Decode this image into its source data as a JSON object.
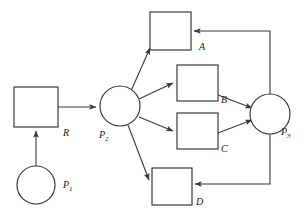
{
  "diagram": {
    "type": "directed-graph",
    "stroke_color": "#3a3a3a",
    "fill_color": "#ffffff",
    "background_color": "#ffffff",
    "places": [
      {
        "id": "P1",
        "label": "P",
        "sub": "1",
        "shape": "circle",
        "cx": 36,
        "cy": 185,
        "r": 19,
        "label_x": 63,
        "label_y": 188
      },
      {
        "id": "P2",
        "label": "P",
        "sub": "2",
        "shape": "circle",
        "cx": 120,
        "cy": 106,
        "r": 20,
        "label_x": 99,
        "label_y": 138
      },
      {
        "id": "P3",
        "label": "P",
        "sub": "3",
        "shape": "circle",
        "cx": 270,
        "cy": 114,
        "r": 20,
        "label_x": 281,
        "label_y": 135
      }
    ],
    "transitions": [
      {
        "id": "R",
        "label": "R",
        "shape": "rect",
        "x": 14,
        "y": 87,
        "w": 44,
        "h": 40,
        "label_x": 63,
        "label_y": 136
      },
      {
        "id": "A",
        "label": "A",
        "shape": "rect",
        "x": 150,
        "y": 12,
        "w": 41,
        "h": 38,
        "label_x": 199,
        "label_y": 50
      },
      {
        "id": "B",
        "label": "B",
        "shape": "rect",
        "x": 177,
        "y": 65,
        "w": 41,
        "h": 36,
        "label_x": 221,
        "label_y": 103
      },
      {
        "id": "C",
        "label": "C",
        "shape": "rect",
        "x": 177,
        "y": 113,
        "w": 41,
        "h": 36,
        "label_x": 221,
        "label_y": 152
      },
      {
        "id": "D",
        "label": "D",
        "shape": "rect",
        "x": 152,
        "y": 168,
        "w": 40,
        "h": 37,
        "label_x": 196,
        "label_y": 205
      }
    ],
    "edges": [
      {
        "id": "P1-R",
        "from": "P1",
        "to": "R",
        "points": "36,166 36,131",
        "arrow": true
      },
      {
        "id": "R-P2",
        "from": "R",
        "to": "P2",
        "points": "58,107 96,107",
        "arrow": true
      },
      {
        "id": "P2-A",
        "from": "P2",
        "to": "A",
        "points": "131,91 150,48",
        "arrow": true
      },
      {
        "id": "P2-B",
        "from": "P2",
        "to": "B",
        "points": "139,99 173,83",
        "arrow": true
      },
      {
        "id": "P2-C",
        "from": "P2",
        "to": "C",
        "points": "139,117 173,131",
        "arrow": true
      },
      {
        "id": "P2-D",
        "from": "P2",
        "to": "D",
        "points": "128,125 149,180",
        "arrow": true
      },
      {
        "id": "B-P3",
        "from": "B",
        "to": "P3",
        "points": "218,95 252,108",
        "arrow": true
      },
      {
        "id": "C-P3",
        "from": "C",
        "to": "P3",
        "points": "218,133 252,120",
        "arrow": true
      },
      {
        "id": "P3-A",
        "from": "P3",
        "to": "A",
        "points": "270,94 270,31 194,31",
        "arrow": true
      },
      {
        "id": "D-P3",
        "from": "D",
        "to": "P3",
        "points": "270,134 270,184 195,184",
        "arrow": true
      }
    ]
  }
}
